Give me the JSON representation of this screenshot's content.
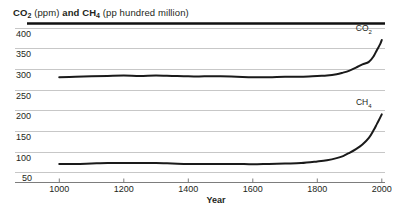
{
  "chart_data": {
    "type": "line",
    "title": "CO2 (ppm) and CH4 (pp hundred million)",
    "title_parts": {
      "co2": "CO",
      "co2_sub": "2",
      "ppm": " (ppm) ",
      "and": "and ",
      "ch4": "CH",
      "ch4_sub": "4",
      "units": " (pp hundred million)"
    },
    "xlabel": "Year",
    "ylabel": "",
    "xlim": [
      900,
      2010
    ],
    "ylim": [
      25,
      410
    ],
    "grid": true,
    "legend_position": "inline-end-of-line",
    "xticks": [
      "1000",
      "1200",
      "1400",
      "1600",
      "1800",
      "2000"
    ],
    "xtick_values": [
      1000,
      1200,
      1400,
      1600,
      1800,
      2000
    ],
    "yticks": [
      "400",
      "350",
      "300",
      "250",
      "200",
      "150",
      "100",
      "50"
    ],
    "ytick_values": [
      400,
      350,
      300,
      250,
      200,
      150,
      100,
      50
    ],
    "series": [
      {
        "name": "CO2",
        "label": "CO",
        "label_sub": "2",
        "color": "#1a1a1a",
        "x": [
          1000,
          1050,
          1100,
          1150,
          1200,
          1250,
          1300,
          1350,
          1400,
          1450,
          1500,
          1550,
          1600,
          1650,
          1700,
          1750,
          1800,
          1830,
          1860,
          1880,
          1900,
          1920,
          1940,
          1960,
          1975,
          1985,
          1995,
          2000
        ],
        "values": [
          280,
          281,
          282,
          283,
          284,
          283,
          284,
          283,
          282,
          282,
          282,
          281,
          280,
          280,
          281,
          281,
          283,
          284,
          287,
          291,
          296,
          303,
          311,
          317,
          331,
          346,
          360,
          370
        ]
      },
      {
        "name": "CH4",
        "label": "CH",
        "label_sub": "4",
        "color": "#1a1a1a",
        "x": [
          1000,
          1050,
          1100,
          1150,
          1200,
          1250,
          1300,
          1350,
          1400,
          1450,
          1500,
          1550,
          1600,
          1650,
          1700,
          1750,
          1800,
          1830,
          1860,
          1880,
          1900,
          1920,
          1940,
          1960,
          1975,
          1985,
          1995,
          2000
        ],
        "values": [
          70,
          70,
          71,
          72,
          72,
          72,
          72,
          71,
          70,
          70,
          70,
          70,
          69,
          70,
          71,
          72,
          76,
          79,
          84,
          89,
          97,
          106,
          117,
          133,
          152,
          167,
          182,
          190
        ]
      }
    ]
  }
}
